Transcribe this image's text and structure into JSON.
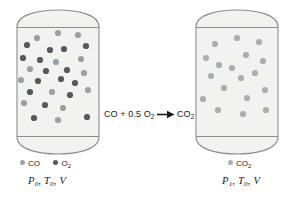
{
  "figure": {
    "colors": {
      "co": "#9aa0a6",
      "o2": "#55585c",
      "co2": "#a9aeb3",
      "vessel_stroke": "#8a8d90",
      "vessel_fill": "#f2f2f0",
      "text": "#1a1a1a",
      "background": "#ffffff"
    },
    "reaction": {
      "reactant_1": "CO",
      "plus": "+",
      "coefficient": "0.5",
      "reactant_2": "O",
      "reactant_2_sub": "2",
      "arrow": "→",
      "product": "CO",
      "product_sub": "2",
      "full_text": "CO + 0.5 O2 → CO2"
    },
    "left_panel": {
      "legend": [
        {
          "label": "CO",
          "sub": "",
          "color_key": "co"
        },
        {
          "label": "O",
          "sub": "2",
          "color_key": "o2"
        }
      ],
      "state_label": {
        "pressure": "P",
        "pressure_sub": "0",
        "temperature": "T",
        "temperature_sub": "0",
        "volume": "V",
        "full_text": "P0, T0, V"
      },
      "molecule_counts": {
        "co": 14,
        "o2": 15,
        "total": 29
      },
      "molecules": [
        {
          "x": 37,
          "y": 38,
          "species": "co"
        },
        {
          "x": 58,
          "y": 33,
          "species": "co"
        },
        {
          "x": 78,
          "y": 35,
          "species": "co"
        },
        {
          "x": 27,
          "y": 45,
          "species": "o2"
        },
        {
          "x": 50,
          "y": 50,
          "species": "o2"
        },
        {
          "x": 64,
          "y": 49,
          "species": "o2"
        },
        {
          "x": 86,
          "y": 46,
          "species": "o2"
        },
        {
          "x": 23,
          "y": 58,
          "species": "o2"
        },
        {
          "x": 40,
          "y": 60,
          "species": "o2"
        },
        {
          "x": 56,
          "y": 62,
          "species": "co"
        },
        {
          "x": 81,
          "y": 59,
          "species": "co"
        },
        {
          "x": 30,
          "y": 69,
          "species": "co"
        },
        {
          "x": 46,
          "y": 71,
          "species": "o2"
        },
        {
          "x": 67,
          "y": 70,
          "species": "o2"
        },
        {
          "x": 84,
          "y": 73,
          "species": "co"
        },
        {
          "x": 21,
          "y": 80,
          "species": "co"
        },
        {
          "x": 38,
          "y": 81,
          "species": "o2"
        },
        {
          "x": 61,
          "y": 79,
          "species": "o2"
        },
        {
          "x": 75,
          "y": 83,
          "species": "o2"
        },
        {
          "x": 30,
          "y": 92,
          "species": "o2"
        },
        {
          "x": 52,
          "y": 92,
          "species": "co"
        },
        {
          "x": 70,
          "y": 95,
          "species": "o2"
        },
        {
          "x": 88,
          "y": 90,
          "species": "co"
        },
        {
          "x": 24,
          "y": 103,
          "species": "co"
        },
        {
          "x": 45,
          "y": 105,
          "species": "o2"
        },
        {
          "x": 63,
          "y": 108,
          "species": "co"
        },
        {
          "x": 34,
          "y": 118,
          "species": "o2"
        },
        {
          "x": 58,
          "y": 120,
          "species": "co"
        },
        {
          "x": 87,
          "y": 117,
          "species": "o2"
        }
      ]
    },
    "right_panel": {
      "legend": [
        {
          "label": "CO",
          "sub": "2",
          "color_key": "co2"
        }
      ],
      "state_label": {
        "pressure": "P",
        "pressure_sub": "1",
        "temperature": "T",
        "temperature_sub": "0",
        "volume": "V",
        "full_text": "P1, T0, V"
      },
      "molecule_counts": {
        "co2": 18,
        "total": 18
      },
      "molecules": [
        {
          "x": 215,
          "y": 44,
          "species": "co2"
        },
        {
          "x": 237,
          "y": 38,
          "species": "co2"
        },
        {
          "x": 259,
          "y": 42,
          "species": "co2"
        },
        {
          "x": 206,
          "y": 58,
          "species": "co2"
        },
        {
          "x": 246,
          "y": 55,
          "species": "co2"
        },
        {
          "x": 263,
          "y": 61,
          "species": "co2"
        },
        {
          "x": 219,
          "y": 65,
          "species": "co2"
        },
        {
          "x": 232,
          "y": 68,
          "species": "co2"
        },
        {
          "x": 255,
          "y": 73,
          "species": "co2"
        },
        {
          "x": 211,
          "y": 76,
          "species": "co2"
        },
        {
          "x": 241,
          "y": 78,
          "species": "co2"
        },
        {
          "x": 224,
          "y": 88,
          "species": "co2"
        },
        {
          "x": 265,
          "y": 90,
          "species": "co2"
        },
        {
          "x": 203,
          "y": 99,
          "species": "co2"
        },
        {
          "x": 247,
          "y": 98,
          "species": "co2"
        },
        {
          "x": 218,
          "y": 110,
          "species": "co2"
        },
        {
          "x": 243,
          "y": 114,
          "species": "co2"
        },
        {
          "x": 266,
          "y": 110,
          "species": "co2"
        }
      ]
    }
  }
}
